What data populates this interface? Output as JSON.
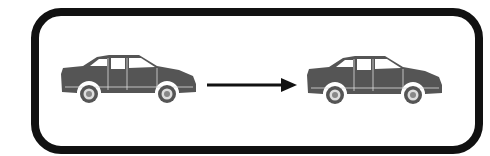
{
  "sign": {
    "description": "Pictogram sign: car, arrow, car",
    "frame_color": "#111111",
    "car_color": "#555555",
    "arrow_color": "#111111"
  },
  "elements": [
    {
      "type": "car-icon",
      "position": "left"
    },
    {
      "type": "arrow-right-icon",
      "position": "center"
    },
    {
      "type": "car-icon",
      "position": "right"
    }
  ]
}
